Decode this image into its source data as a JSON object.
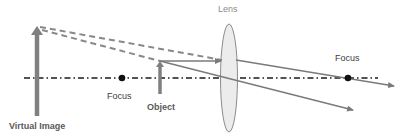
{
  "diagram": {
    "type": "ray-diagram-convex-lens-virtual-image",
    "labels": {
      "lens": "Lens",
      "focus_left": "Focus",
      "focus_right": "Focus",
      "object": "Object",
      "virtual_image": "Virtual Image"
    },
    "colors": {
      "ray": "#7a7a7a",
      "axis": "#1a1a1a",
      "lens_fill": "#ececec",
      "lens_stroke": "#8c8c8c",
      "arrow": "#7f7f7f",
      "focus_dot": "#111111"
    }
  }
}
